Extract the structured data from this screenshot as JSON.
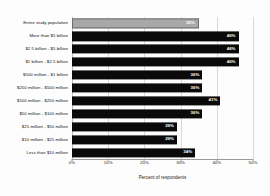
{
  "chart_data": {
    "type": "bar",
    "orientation": "horizontal",
    "title": "",
    "xlabel": "Percent of respondents",
    "ylabel": "",
    "xlim": [
      0,
      50
    ],
    "xticks": [
      "0%",
      "10%",
      "20%",
      "30%",
      "40%",
      "50%"
    ],
    "xtick_values": [
      0,
      10,
      20,
      30,
      40,
      50
    ],
    "grid": true,
    "legend": "none",
    "categories": [
      "Entire study population",
      "More than $5 billion",
      "$2.5 billion - $5 billion",
      "$1 billion - $2.5 billion",
      "$500 million - $1 billion",
      "$250 million - $500 million",
      "$100 million - $250 million",
      "$50 million - $100 million",
      "$25 million - $50 million",
      "$10 million - $25 million",
      "Less than $10 million"
    ],
    "values": [
      35,
      46,
      46,
      46,
      36,
      36,
      41,
      36,
      29,
      29,
      34
    ],
    "value_labels": [
      "35%",
      "46%",
      "46%",
      "46%",
      "36%",
      "36%",
      "41%",
      "36%",
      "29%",
      "29%",
      "34%"
    ],
    "bar_colors": [
      "#a8a8a8",
      "#0a0a0a",
      "#0a0a0a",
      "#0a0a0a",
      "#0a0a0a",
      "#0a0a0a",
      "#0a0a0a",
      "#0a0a0a",
      "#0a0a0a",
      "#0a0a0a",
      "#0a0a0a"
    ],
    "highlight_index": 0,
    "colors": {
      "highlight_bar": "#a8a8a8",
      "highlight_border": "#6d6d6d",
      "bar": "#0a0a0a",
      "grid": "#d9d9d9",
      "axis": "#9a9a9a",
      "label": "#111111",
      "value_label": "#ffffff",
      "background": "#fdfdfd"
    }
  }
}
